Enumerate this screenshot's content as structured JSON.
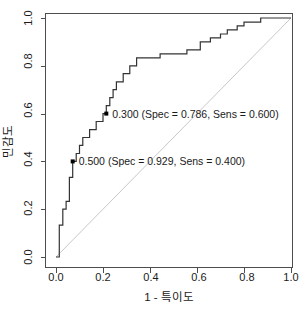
{
  "chart_data": {
    "type": "line",
    "title": "",
    "subtitle": "",
    "xlabel": "1 - 특이도",
    "ylabel": "민감도",
    "xlim": [
      0.0,
      1.0
    ],
    "ylim": [
      0.0,
      1.0
    ],
    "grid": false,
    "legend": "none",
    "x_ticks": [
      "0.0",
      "0.2",
      "0.4",
      "0.6",
      "0.8",
      "1.0"
    ],
    "x_tick_values": [
      0.0,
      0.2,
      0.4,
      0.6,
      0.8,
      1.0
    ],
    "y_ticks": [
      "0.0",
      "0.2",
      "0.4",
      "0.6",
      "0.8",
      "1.0"
    ],
    "y_tick_values": [
      0.0,
      0.2,
      0.4,
      0.6,
      0.8,
      1.0
    ],
    "series": [
      {
        "name": "ROC curve",
        "type": "step",
        "color": "#333333",
        "x": [
          0.0,
          0.014,
          0.014,
          0.029,
          0.029,
          0.043,
          0.043,
          0.057,
          0.057,
          0.057,
          0.071,
          0.071,
          0.071,
          0.086,
          0.086,
          0.1,
          0.1,
          0.114,
          0.114,
          0.129,
          0.129,
          0.143,
          0.143,
          0.157,
          0.157,
          0.171,
          0.171,
          0.186,
          0.186,
          0.2,
          0.2,
          0.214,
          0.214,
          0.229,
          0.229,
          0.243,
          0.243,
          0.257,
          0.257,
          0.286,
          0.286,
          0.314,
          0.314,
          0.343,
          0.343,
          0.443,
          0.443,
          0.557,
          0.557,
          0.586,
          0.586,
          0.614,
          0.614,
          0.657,
          0.657,
          0.7,
          0.7,
          0.729,
          0.729,
          0.771,
          0.771,
          0.8,
          0.8,
          0.871,
          0.871,
          1.0
        ],
        "y": [
          0.0,
          0.0,
          0.133,
          0.133,
          0.2,
          0.2,
          0.233,
          0.233,
          0.267,
          0.333,
          0.333,
          0.367,
          0.4,
          0.4,
          0.433,
          0.433,
          0.467,
          0.467,
          0.5,
          0.5,
          0.5,
          0.5,
          0.533,
          0.533,
          0.533,
          0.533,
          0.567,
          0.567,
          0.567,
          0.567,
          0.6,
          0.6,
          0.633,
          0.633,
          0.667,
          0.667,
          0.7,
          0.7,
          0.733,
          0.733,
          0.767,
          0.767,
          0.8,
          0.8,
          0.833,
          0.833,
          0.85,
          0.85,
          0.867,
          0.867,
          0.867,
          0.867,
          0.9,
          0.9,
          0.917,
          0.917,
          0.933,
          0.933,
          0.95,
          0.95,
          0.967,
          0.967,
          0.983,
          0.983,
          1.0,
          1.0
        ]
      },
      {
        "name": "chance line",
        "type": "line",
        "color": "#c8c8c8",
        "x": [
          0.0,
          1.0
        ],
        "y": [
          0.0,
          1.0
        ]
      }
    ],
    "annotations": [
      {
        "id": "threshold-0300",
        "label": "0.300 (Spec = 0.786, Sens = 0.600)",
        "threshold": "0.300",
        "spec": "0.786",
        "sens": "0.600",
        "x": 0.214,
        "y": 0.6
      },
      {
        "id": "threshold-0500",
        "label": "0.500 (Spec = 0.929, Sens = 0.400)",
        "threshold": "0.500",
        "spec": "0.929",
        "sens": "0.400",
        "x": 0.071,
        "y": 0.4
      }
    ]
  },
  "axes": {
    "x_title": "1 - 특이도",
    "y_title": "민감도",
    "x_tick_0": "0.0",
    "x_tick_1": "0.2",
    "x_tick_2": "0.4",
    "x_tick_3": "0.6",
    "x_tick_4": "0.8",
    "x_tick_5": "1.0",
    "y_tick_0": "0.0",
    "y_tick_1": "0.2",
    "y_tick_2": "0.4",
    "y_tick_3": "0.6",
    "y_tick_4": "0.8",
    "y_tick_5": "1.0"
  },
  "labels": {
    "point_a": "0.300 (Spec = 0.786, Sens = 0.600)",
    "point_b": "0.500 (Spec = 0.929, Sens = 0.400)"
  },
  "colors": {
    "curve": "#333333",
    "chance": "#c8c8c8",
    "axis": "#4d4d4d",
    "text": "#1a1a1a",
    "background": "#ffffff"
  }
}
